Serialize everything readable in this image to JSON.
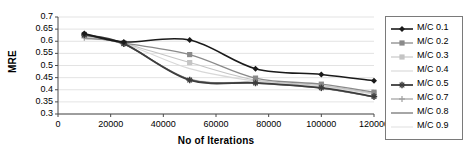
{
  "chart_data": {
    "type": "line",
    "title": "",
    "xlabel": "No of Iterations",
    "ylabel": "MRE",
    "x": [
      10000,
      25000,
      50000,
      75000,
      100000,
      120000
    ],
    "xlim": [
      0,
      120000
    ],
    "ylim": [
      0.3,
      0.7
    ],
    "xticks": [
      "0",
      "20000",
      "40000",
      "60000",
      "80000",
      "100000",
      "120000"
    ],
    "yticks": [
      "0.7",
      "0.65",
      "0.6",
      "0.55",
      "0.5",
      "0.45",
      "0.4",
      "0.35",
      "0.3"
    ],
    "grid": "horizontal",
    "legend_position": "right-outside",
    "series": [
      {
        "name": "M/C 0.1",
        "values": [
          0.632,
          0.597,
          0.605,
          0.487,
          0.463,
          0.437
        ],
        "color": "#1a1a1a",
        "marker": "diamond",
        "width": 1.6
      },
      {
        "name": "M/C 0.2",
        "values": [
          0.628,
          0.593,
          0.545,
          0.448,
          0.423,
          0.39
        ],
        "color": "#8a8a8a",
        "marker": "square",
        "width": 1.3
      },
      {
        "name": "M/C 0.3",
        "values": [
          0.624,
          0.592,
          0.512,
          0.44,
          0.417,
          0.385
        ],
        "color": "#c4c4c4",
        "marker": "square",
        "width": 1.1
      },
      {
        "name": "M/C 0.4",
        "values": [
          0.62,
          0.591,
          0.487,
          0.436,
          0.413,
          0.381
        ],
        "color": "#d8d8d8",
        "marker": "none",
        "width": 1.1
      },
      {
        "name": "M/C 0.5",
        "values": [
          0.626,
          0.59,
          0.44,
          0.428,
          0.408,
          0.372
        ],
        "color": "#3d3d3d",
        "marker": "star",
        "width": 1.8
      },
      {
        "name": "M/C 0.7",
        "values": [
          0.614,
          0.589,
          0.441,
          0.427,
          0.406,
          0.37
        ],
        "color": "#9e9e9e",
        "marker": "plus",
        "width": 1.2
      },
      {
        "name": "M/C 0.8",
        "values": [
          0.612,
          0.588,
          0.443,
          0.429,
          0.407,
          0.371
        ],
        "color": "#6b6b6b",
        "marker": "none",
        "width": 1.2
      },
      {
        "name": "M/C 0.9",
        "values": [
          0.61,
          0.587,
          0.445,
          0.43,
          0.409,
          0.373
        ],
        "color": "#e2e2e2",
        "marker": "none",
        "width": 1.1
      }
    ]
  },
  "legend": {
    "items": [
      {
        "label": "M/C 0.1"
      },
      {
        "label": "M/C 0.2"
      },
      {
        "label": "M/C 0.3"
      },
      {
        "label": "M/C 0.4"
      },
      {
        "label": "M/C 0.5"
      },
      {
        "label": "M/C 0.7"
      },
      {
        "label": "M/C 0.8"
      },
      {
        "label": "M/C 0.9"
      }
    ]
  }
}
